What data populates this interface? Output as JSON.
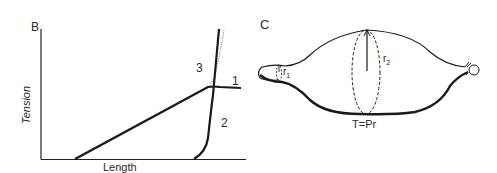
{
  "panel_b": {
    "label": "B",
    "x_axis_label": "Length",
    "y_axis_label": "Tension",
    "curves": [
      {
        "id": "1",
        "label": "1",
        "style": "solid"
      },
      {
        "id": "2",
        "label": "2",
        "style": "solid"
      },
      {
        "id": "3",
        "label": "3",
        "style": "dotted"
      }
    ]
  },
  "panel_c": {
    "label": "C",
    "r1_label": "r",
    "r1_sub": "1",
    "r2_label": "r",
    "r2_sub": "2",
    "equation": "T=Pr"
  },
  "colors": {
    "ink": "#222222",
    "background": "#ffffff"
  }
}
